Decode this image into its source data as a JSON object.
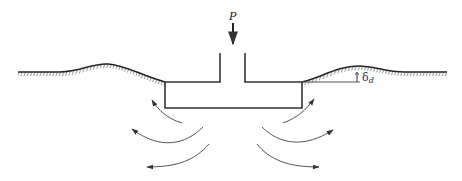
{
  "diagram": {
    "title": "",
    "load_label": "P",
    "settlement_label": "δ",
    "settlement_subscript": "d",
    "colors": {
      "stroke": "#333333",
      "ground": "#222222",
      "arrows": "#555555",
      "background": "#ffffff"
    },
    "elements": [
      "ground-surface-left-with-heave",
      "ground-surface-right-with-heave",
      "T-shaped-footing",
      "vertical-load-arrow-P",
      "heave-dimension-delta-d",
      "soil-flow-arrows-left-3",
      "soil-flow-arrows-right-3"
    ]
  }
}
